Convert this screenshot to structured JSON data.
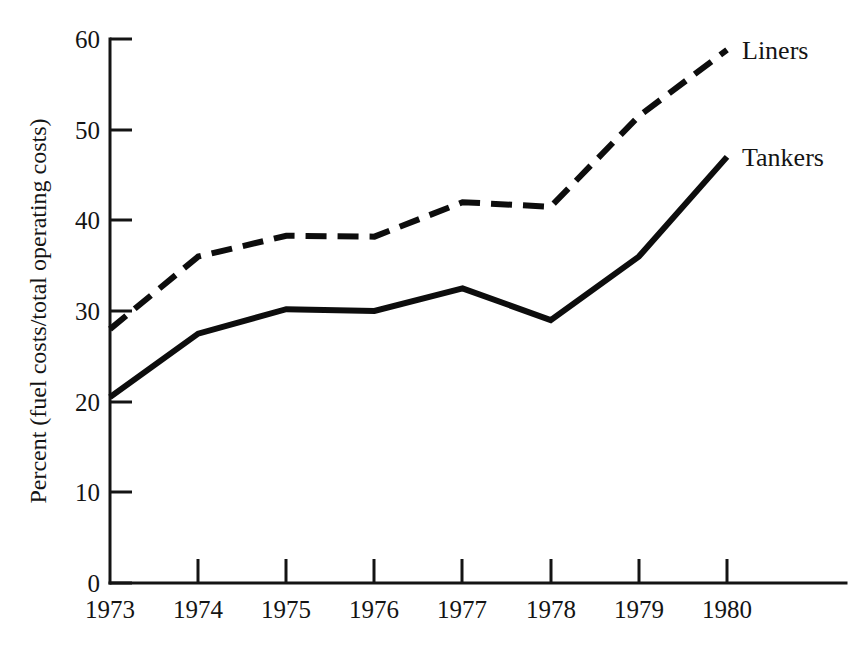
{
  "chart_data": {
    "type": "line",
    "title": "",
    "subtitle": "",
    "xlabel": "",
    "ylabel": "Percent (fuel costs/total operating costs)",
    "categories": [
      "1973",
      "1974",
      "1975",
      "1976",
      "1977",
      "1978",
      "1979",
      "1980"
    ],
    "x": [
      1973,
      1974,
      1975,
      1976,
      1977,
      1978,
      1979,
      1980
    ],
    "xlim": [
      1973,
      1980
    ],
    "ylim": [
      0,
      60
    ],
    "yticks": [
      0,
      10,
      20,
      30,
      40,
      50,
      60
    ],
    "ytick_labels": [
      "0",
      "10",
      "20",
      "30",
      "40",
      "50",
      "60"
    ],
    "xtick_labels": [
      "1973",
      "1974",
      "1975",
      "1976",
      "1977",
      "1978",
      "1979",
      "1980"
    ],
    "grid": false,
    "legend_position": "right-inline-end-of-line",
    "series": [
      {
        "name": "Liners",
        "style": "dashed",
        "color": "#0d0d0d",
        "values": [
          28.0,
          36.0,
          38.3,
          38.2,
          42.0,
          41.5,
          51.5,
          58.8
        ]
      },
      {
        "name": "Tankers",
        "style": "solid",
        "color": "#0d0d0d",
        "values": [
          20.5,
          27.5,
          30.2,
          30.0,
          32.5,
          29.0,
          36.0,
          47.0
        ]
      }
    ],
    "annotations": [
      {
        "text": "Liners",
        "at_x": 1980,
        "at_y": 58.8
      },
      {
        "text": "Tankers",
        "at_x": 1980,
        "at_y": 47.0
      }
    ]
  },
  "labels": {
    "y_axis_title": "Percent (fuel costs/total operating costs)",
    "series_liners": "Liners",
    "series_tankers": "Tankers",
    "y_0": "0",
    "y_10": "10",
    "y_20": "20",
    "y_30": "30",
    "y_40": "40",
    "y_50": "50",
    "y_60": "60",
    "x_1973": "1973",
    "x_1974": "1974",
    "x_1975": "1975",
    "x_1976": "1976",
    "x_1977": "1977",
    "x_1978": "1978",
    "x_1979": "1979",
    "x_1980": "1980"
  },
  "colors": {
    "ink": "#141414",
    "series": "#0d0d0d",
    "background": "#ffffff"
  }
}
